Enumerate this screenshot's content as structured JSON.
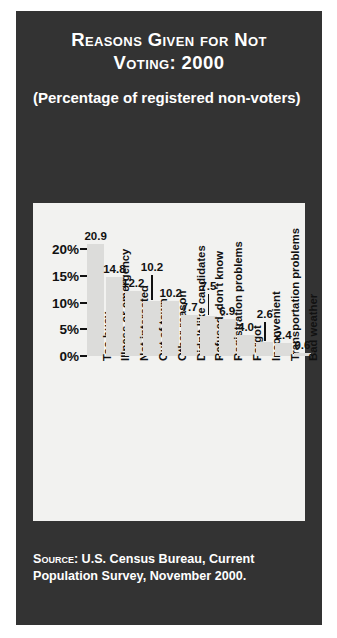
{
  "title": {
    "line1": "Reasons Given for Not",
    "line2": "Voting: 2000"
  },
  "subtitle": "(Percentage of registered non-voters)",
  "source": {
    "label": "Source:",
    "text": "U.S. Census Bureau, Current Population Survey, November 2000."
  },
  "colors": {
    "panel_background": "#333333",
    "plot_background": "#f2f2f0",
    "bar_fill": "#dcdcda",
    "text_light": "#ffffff",
    "text_dark": "#111111"
  },
  "chart_data": {
    "type": "bar",
    "title": "Reasons Given for Not Voting: 2000",
    "subtitle": "(Percentage of registered non-voters)",
    "xlabel": "",
    "ylabel": "",
    "ylim": [
      0,
      22.5
    ],
    "grid": false,
    "legend": "none",
    "ytick_labels": [
      "20%",
      "15%",
      "10%",
      "5%",
      "0%"
    ],
    "ytick_values": [
      20,
      15,
      10,
      5,
      0
    ],
    "categories": [
      "Too busy",
      "Illness or emergency",
      "Not interested",
      "Out of town",
      "Other reason",
      "Didn't like candidates",
      "Refused, don't know",
      "Registration problems",
      "Forgot",
      "Inconvenient",
      "Transportation problems",
      "Bad weather"
    ],
    "values": [
      20.9,
      14.8,
      12.2,
      10.2,
      10.2,
      7.7,
      7.5,
      6.9,
      4.0,
      2.6,
      2.4,
      0.6
    ],
    "value_labels": [
      "20.9",
      "14.8",
      "12.2",
      "10.2",
      "10.2",
      "7.7",
      "7.5",
      "6.9",
      "4.0",
      "2.6",
      "2.4",
      "0.6"
    ]
  }
}
